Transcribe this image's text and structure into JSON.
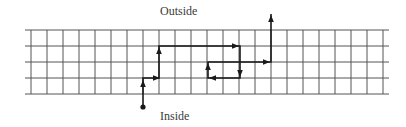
{
  "labels": {
    "outside": "Outside",
    "inside": "Inside"
  },
  "grid": {
    "x_start": 25,
    "x_end": 389,
    "y_start": 30,
    "rows": 4,
    "cell": 16,
    "first_col_x": 31,
    "cols": 23,
    "line_color": "#555555"
  },
  "path": {
    "color": "#1a1a1a",
    "start_dot": {
      "x": 143,
      "y": 107
    },
    "points": [
      [
        143,
        107
      ],
      [
        143,
        78
      ],
      [
        159,
        78
      ],
      [
        159,
        46
      ],
      [
        240,
        46
      ],
      [
        240,
        78
      ],
      [
        208,
        78
      ],
      [
        208,
        62
      ],
      [
        271,
        62
      ],
      [
        271,
        14
      ]
    ],
    "arrows": [
      {
        "x": 143,
        "y": 84,
        "dir": "up"
      },
      {
        "x": 156,
        "y": 78,
        "dir": "right"
      },
      {
        "x": 159,
        "y": 51,
        "dir": "up"
      },
      {
        "x": 235,
        "y": 46,
        "dir": "right"
      },
      {
        "x": 240,
        "y": 73,
        "dir": "down"
      },
      {
        "x": 213,
        "y": 78,
        "dir": "left"
      },
      {
        "x": 208,
        "y": 67,
        "dir": "up"
      },
      {
        "x": 266,
        "y": 62,
        "dir": "right"
      },
      {
        "x": 271,
        "y": 19,
        "dir": "up"
      }
    ]
  }
}
